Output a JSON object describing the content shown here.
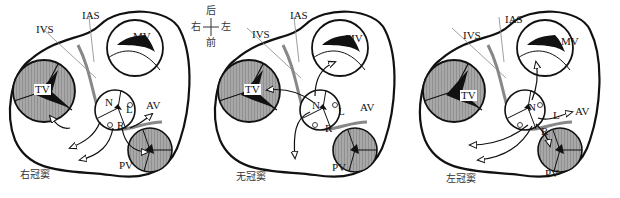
{
  "figure": {
    "compass": {
      "top": "后",
      "bottom": "前",
      "left": "右",
      "right": "左"
    },
    "labels": {
      "ias": "IAS",
      "ivs": "IVS",
      "mv": "MV",
      "tv": "TV",
      "av": "AV",
      "pv": "PV",
      "n": "N",
      "l": "L",
      "r": "R"
    },
    "panels": [
      {
        "id": "right",
        "caption": "右冠窦"
      },
      {
        "id": "noncoronary",
        "caption": "无冠窦"
      },
      {
        "id": "left",
        "caption": "左冠窦"
      }
    ],
    "colors": {
      "line": "#111111",
      "septum": "#888888",
      "valve_fill": "#a8a8a8",
      "background": "#ffffff"
    }
  }
}
